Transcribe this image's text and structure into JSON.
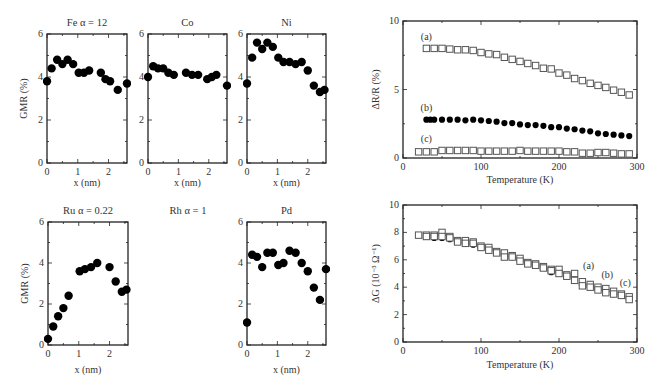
{
  "chart_data": [
    {
      "id": "fe",
      "type": "scatter",
      "title": "Fe α = 12",
      "xlabel": "x (nm)",
      "ylabel": "GMR (%)",
      "xlim": [
        0,
        2.6
      ],
      "ylim": [
        0,
        6
      ],
      "xticks": [
        "0",
        "1",
        "2"
      ],
      "yticks": [
        "0",
        "2",
        "4",
        "6"
      ],
      "x": [
        0.0,
        0.15,
        0.33,
        0.5,
        0.67,
        0.85,
        1.03,
        1.2,
        1.37,
        1.75,
        1.9,
        2.05,
        2.3,
        2.6
      ],
      "y": [
        3.8,
        4.4,
        4.8,
        4.6,
        4.8,
        4.6,
        4.2,
        4.2,
        4.3,
        4.2,
        3.9,
        3.8,
        3.4,
        3.7
      ]
    },
    {
      "id": "co",
      "type": "scatter",
      "title": "Co",
      "xlabel": "x (nm)",
      "ylabel": "",
      "xlim": [
        0,
        2.6
      ],
      "ylim": [
        0,
        6
      ],
      "xticks": [
        "0",
        "1",
        "2"
      ],
      "yticks": [
        "0",
        "2",
        "4",
        "6"
      ],
      "x": [
        0.0,
        0.17,
        0.33,
        0.5,
        0.67,
        0.85,
        1.25,
        1.45,
        1.65,
        1.95,
        2.1,
        2.25,
        2.6
      ],
      "y": [
        4.0,
        4.5,
        4.4,
        4.4,
        4.2,
        4.1,
        4.2,
        4.1,
        4.1,
        3.9,
        4.0,
        4.1,
        3.6
      ]
    },
    {
      "id": "ni",
      "type": "scatter",
      "title": "Ni",
      "xlabel": "x (nm)",
      "ylabel": "",
      "xlim": [
        0,
        2.6
      ],
      "ylim": [
        0,
        6
      ],
      "xticks": [
        "0",
        "1",
        "2"
      ],
      "yticks": [
        "0",
        "2",
        "4",
        "6"
      ],
      "x": [
        0.0,
        0.17,
        0.33,
        0.5,
        0.67,
        0.85,
        1.03,
        1.2,
        1.4,
        1.6,
        1.8,
        2.0,
        2.2,
        2.4,
        2.55
      ],
      "y": [
        3.7,
        4.9,
        5.6,
        5.3,
        5.6,
        5.4,
        4.9,
        4.7,
        4.7,
        4.6,
        4.7,
        4.3,
        3.6,
        3.3,
        3.4
      ]
    },
    {
      "id": "ru",
      "type": "scatter",
      "title": "Ru α = 0.22",
      "xlabel": "x (nm)",
      "ylabel": "GMR (%)",
      "xlim": [
        0,
        2.6
      ],
      "ylim": [
        0,
        6
      ],
      "xticks": [
        "0",
        "1",
        "2"
      ],
      "yticks": [
        "0",
        "2",
        "4",
        "6"
      ],
      "x": [
        0.0,
        0.17,
        0.33,
        0.5,
        0.67,
        1.03,
        1.2,
        1.4,
        1.6,
        2.0,
        2.2,
        2.4,
        2.55
      ],
      "y": [
        0.3,
        0.9,
        1.4,
        1.8,
        2.4,
        3.6,
        3.7,
        3.8,
        4.0,
        3.8,
        3.1,
        2.6,
        2.7
      ]
    },
    {
      "id": "rh",
      "type": "scatter",
      "title": "Rh α = 1",
      "note": "no plot drawn",
      "x": [],
      "y": []
    },
    {
      "id": "pd",
      "type": "scatter",
      "title": "Pd",
      "xlabel": "x (nm)",
      "ylabel": "",
      "xlim": [
        0,
        2.6
      ],
      "ylim": [
        0,
        6
      ],
      "xticks": [
        "0",
        "1",
        "2"
      ],
      "yticks": [
        "0",
        "2",
        "4",
        "6"
      ],
      "x": [
        0.0,
        0.17,
        0.33,
        0.5,
        0.67,
        0.85,
        1.03,
        1.2,
        1.4,
        1.6,
        1.8,
        2.0,
        2.2,
        2.4,
        2.6
      ],
      "y": [
        1.1,
        4.4,
        4.3,
        3.8,
        4.5,
        4.5,
        3.9,
        4.0,
        4.6,
        4.5,
        4.0,
        3.6,
        2.8,
        2.2,
        3.7
      ]
    },
    {
      "id": "dr",
      "type": "scatter",
      "title": "",
      "xlabel": "Temperature (K)",
      "ylabel": "ΔR/R (%)",
      "xlim": [
        0,
        300
      ],
      "ylim": [
        0,
        10
      ],
      "xticks": [
        "0",
        "100",
        "200",
        "300"
      ],
      "yticks": [
        "0",
        "5",
        "10"
      ],
      "series": [
        {
          "name": "(a)",
          "marker": "open-square",
          "x": [
            30,
            40,
            50,
            60,
            70,
            80,
            90,
            100,
            110,
            120,
            130,
            140,
            150,
            160,
            170,
            180,
            190,
            200,
            210,
            220,
            230,
            240,
            250,
            260,
            270,
            280,
            290
          ],
          "y": [
            8.0,
            8.0,
            8.0,
            7.95,
            7.9,
            7.9,
            7.85,
            7.7,
            7.6,
            7.55,
            7.35,
            7.2,
            7.05,
            6.9,
            6.75,
            6.55,
            6.5,
            6.2,
            6.05,
            5.8,
            5.65,
            5.45,
            5.3,
            5.15,
            4.95,
            4.8,
            4.6
          ]
        },
        {
          "name": "(b)",
          "marker": "filled-circle",
          "x": [
            30,
            35,
            40,
            50,
            60,
            70,
            80,
            90,
            100,
            110,
            120,
            130,
            140,
            150,
            160,
            170,
            180,
            190,
            200,
            210,
            220,
            230,
            240,
            250,
            260,
            270,
            280,
            290
          ],
          "y": [
            2.8,
            2.8,
            2.8,
            2.8,
            2.8,
            2.8,
            2.75,
            2.8,
            2.75,
            2.7,
            2.65,
            2.55,
            2.55,
            2.45,
            2.4,
            2.4,
            2.35,
            2.25,
            2.25,
            2.15,
            2.1,
            2.0,
            1.95,
            1.8,
            1.75,
            1.7,
            1.65,
            1.6
          ]
        },
        {
          "name": "(c)",
          "marker": "open-square",
          "x": [
            20,
            30,
            40,
            50,
            60,
            70,
            80,
            90,
            100,
            110,
            120,
            130,
            140,
            150,
            160,
            170,
            180,
            190,
            200,
            210,
            220,
            230,
            240,
            250,
            260,
            270,
            280,
            290
          ],
          "y": [
            0.45,
            0.45,
            0.45,
            0.55,
            0.55,
            0.55,
            0.55,
            0.55,
            0.5,
            0.5,
            0.5,
            0.5,
            0.5,
            0.55,
            0.5,
            0.5,
            0.5,
            0.5,
            0.5,
            0.45,
            0.45,
            0.35,
            0.35,
            0.4,
            0.4,
            0.35,
            0.3,
            0.3
          ]
        }
      ]
    },
    {
      "id": "dg",
      "type": "scatter",
      "title": "",
      "xlabel": "Temperature (K)",
      "ylabel": "ΔG (10⁻³ Ω⁻¹)",
      "xlim": [
        0,
        300
      ],
      "ylim": [
        0,
        10
      ],
      "xticks": [
        "0",
        "100",
        "200",
        "300"
      ],
      "yticks": [
        "0",
        "2",
        "4",
        "6",
        "8",
        "10"
      ],
      "series": [
        {
          "name": "(a)",
          "marker": "open-square",
          "x": [
            20,
            30,
            40,
            50,
            60,
            70,
            80,
            90,
            100,
            110,
            120,
            130,
            140,
            150,
            160,
            170,
            180,
            190,
            200,
            210,
            220,
            230,
            240,
            250,
            260,
            270,
            280,
            290
          ],
          "y": [
            7.8,
            7.8,
            7.8,
            8.0,
            7.7,
            7.4,
            7.4,
            7.3,
            7.0,
            6.9,
            6.6,
            6.5,
            6.3,
            6.1,
            5.8,
            5.7,
            5.5,
            5.3,
            5.3,
            4.9,
            5.0,
            4.4,
            4.2,
            4.0,
            3.9,
            3.7,
            3.5,
            3.3
          ]
        },
        {
          "name": "(b)",
          "marker": "filled-circle",
          "x": [
            30,
            40,
            50,
            60,
            70,
            80,
            90,
            100,
            110,
            120,
            130,
            140,
            150,
            160,
            170,
            180,
            190,
            200,
            210,
            220,
            230,
            240,
            250,
            260,
            270,
            280,
            290
          ],
          "y": [
            7.7,
            7.6,
            7.6,
            7.5,
            7.4,
            7.2,
            7.1,
            6.9,
            6.8,
            6.5,
            6.3,
            6.2,
            6.0,
            5.7,
            5.6,
            5.4,
            5.1,
            5.0,
            4.8,
            4.6,
            4.3,
            4.2,
            3.9,
            3.7,
            3.5,
            3.4,
            3.2
          ]
        },
        {
          "name": "(c)",
          "marker": "open-square",
          "x": [
            30,
            40,
            50,
            60,
            70,
            80,
            90,
            100,
            110,
            120,
            130,
            140,
            150,
            160,
            170,
            180,
            190,
            200,
            210,
            220,
            230,
            240,
            250,
            260,
            270,
            280,
            290
          ],
          "y": [
            7.7,
            7.7,
            7.7,
            7.6,
            7.3,
            7.2,
            7.2,
            6.9,
            6.7,
            6.5,
            6.2,
            6.2,
            5.9,
            5.7,
            5.6,
            5.4,
            5.2,
            5.0,
            4.8,
            4.5,
            4.1,
            4.0,
            3.8,
            3.6,
            3.5,
            3.4,
            3.1
          ]
        }
      ]
    }
  ]
}
